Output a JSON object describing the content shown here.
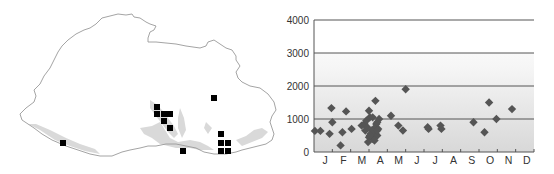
{
  "map": {
    "title": "",
    "outline_color": "#9a9a9a",
    "lowland_fill": "#d6d6d6",
    "marker_color": "#000000",
    "marker_size": 6,
    "markers": [
      {
        "x": 157,
        "y": 107
      },
      {
        "x": 157,
        "y": 114
      },
      {
        "x": 164,
        "y": 114
      },
      {
        "x": 170,
        "y": 114
      },
      {
        "x": 164,
        "y": 121
      },
      {
        "x": 170,
        "y": 128
      },
      {
        "x": 214,
        "y": 98
      },
      {
        "x": 63,
        "y": 143
      },
      {
        "x": 183,
        "y": 151
      },
      {
        "x": 221,
        "y": 134
      },
      {
        "x": 221,
        "y": 143
      },
      {
        "x": 228,
        "y": 143
      },
      {
        "x": 221,
        "y": 151
      },
      {
        "x": 228,
        "y": 151
      }
    ]
  },
  "chart_data": {
    "type": "scatter",
    "title": "",
    "xlabel": "",
    "ylabel": "",
    "ylim": [
      0,
      4000
    ],
    "yticks": [
      0,
      1000,
      2000,
      3000,
      4000
    ],
    "ytick_labels": [
      "0",
      "1000",
      "2000",
      "3000",
      "4000"
    ],
    "categories": [
      "J",
      "F",
      "M",
      "A",
      "M",
      "J",
      "J",
      "A",
      "S",
      "O",
      "N",
      "D"
    ],
    "grid": true,
    "legend": "none",
    "marker": "diamond",
    "marker_color": "#555555",
    "series": [
      {
        "name": "records",
        "points": [
          {
            "month": 0.05,
            "value": 640
          },
          {
            "month": 0.35,
            "value": 640
          },
          {
            "month": 0.85,
            "value": 550
          },
          {
            "month": 0.95,
            "value": 1330
          },
          {
            "month": 1.0,
            "value": 900
          },
          {
            "month": 1.45,
            "value": 200
          },
          {
            "month": 1.55,
            "value": 600
          },
          {
            "month": 1.75,
            "value": 1230
          },
          {
            "month": 2.05,
            "value": 700
          },
          {
            "month": 2.6,
            "value": 800
          },
          {
            "month": 2.75,
            "value": 850
          },
          {
            "month": 2.8,
            "value": 650
          },
          {
            "month": 2.85,
            "value": 950
          },
          {
            "month": 2.9,
            "value": 750
          },
          {
            "month": 3.0,
            "value": 1250
          },
          {
            "month": 3.05,
            "value": 1050
          },
          {
            "month": 3.2,
            "value": 1050
          },
          {
            "month": 3.25,
            "value": 700
          },
          {
            "month": 3.35,
            "value": 1550
          },
          {
            "month": 3.4,
            "value": 850
          },
          {
            "month": 3.0,
            "value": 450
          },
          {
            "month": 2.95,
            "value": 300
          },
          {
            "month": 3.1,
            "value": 550
          },
          {
            "month": 3.2,
            "value": 400
          },
          {
            "month": 3.3,
            "value": 500
          },
          {
            "month": 3.15,
            "value": 650
          },
          {
            "month": 3.25,
            "value": 450
          },
          {
            "month": 3.35,
            "value": 550
          },
          {
            "month": 3.45,
            "value": 500
          },
          {
            "month": 3.5,
            "value": 700
          },
          {
            "month": 3.55,
            "value": 1000
          },
          {
            "month": 3.45,
            "value": 650
          },
          {
            "month": 3.05,
            "value": 500
          },
          {
            "month": 3.3,
            "value": 350
          },
          {
            "month": 3.45,
            "value": 900
          },
          {
            "month": 4.2,
            "value": 1100
          },
          {
            "month": 4.6,
            "value": 800
          },
          {
            "month": 4.85,
            "value": 650
          },
          {
            "month": 5.0,
            "value": 1900
          },
          {
            "month": 6.2,
            "value": 750
          },
          {
            "month": 6.25,
            "value": 700
          },
          {
            "month": 6.9,
            "value": 800
          },
          {
            "month": 6.95,
            "value": 700
          },
          {
            "month": 8.7,
            "value": 900
          },
          {
            "month": 9.3,
            "value": 600
          },
          {
            "month": 9.55,
            "value": 1500
          },
          {
            "month": 9.95,
            "value": 1000
          },
          {
            "month": 10.8,
            "value": 1300
          }
        ]
      }
    ]
  }
}
